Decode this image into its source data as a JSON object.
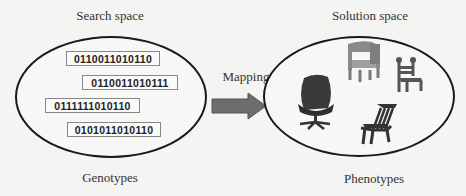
{
  "left": {
    "title": "Search space",
    "caption": "Genotypes",
    "genotypes": [
      "0110011010110",
      "0110011010111",
      "0111111010110",
      "0101011010110"
    ]
  },
  "mapping": {
    "label": "Mapping",
    "arrow_color": "#6d6d6d"
  },
  "right": {
    "title": "Solution space",
    "caption": "Phenotypes",
    "phenotypes": [
      "office-chair",
      "armchair",
      "wooden-chair",
      "deck-chair"
    ]
  },
  "colors": {
    "ellipse_stroke": "#1a1a1a",
    "box_border": "#888888",
    "chair_dark": "#3a3a3a",
    "chair_gray": "#8a8a8a"
  }
}
